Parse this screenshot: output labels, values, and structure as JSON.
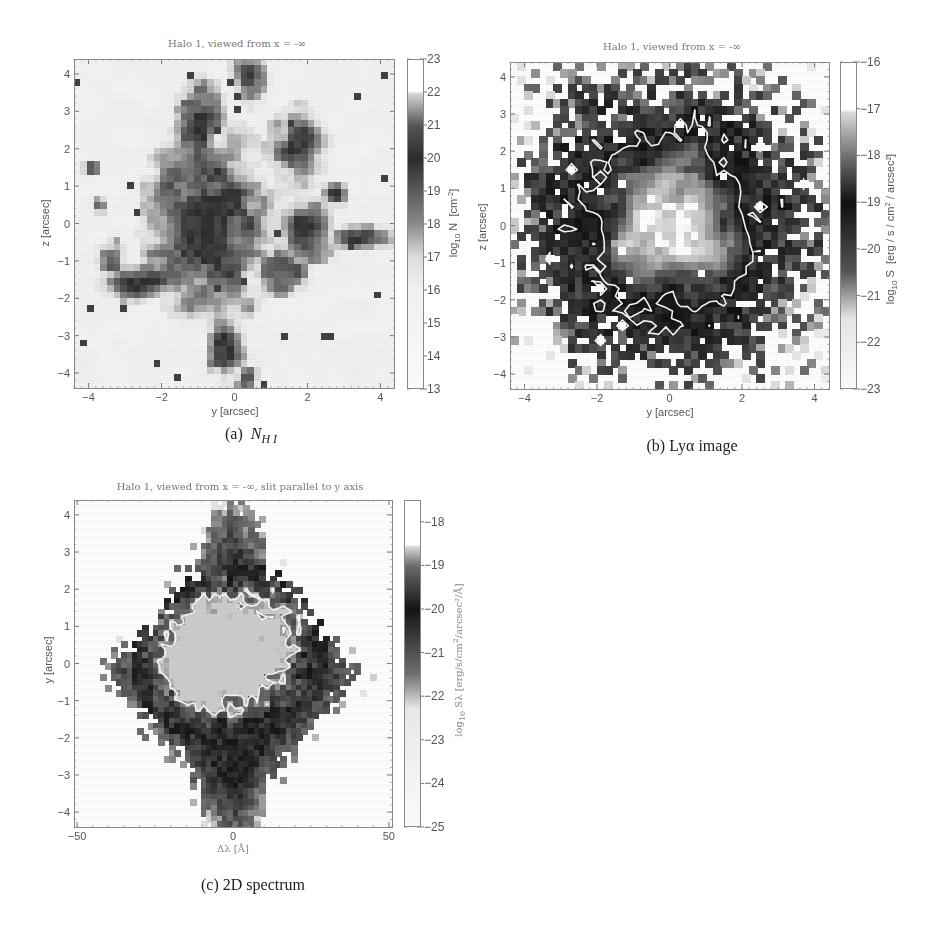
{
  "chart_data": [
    {
      "id": "a",
      "type": "heatmap",
      "title": "Halo 1, viewed from x = -∞",
      "xlabel": "y [arcsec]",
      "ylabel": "z [arcsec]",
      "xlim": [
        -4.4,
        4.4
      ],
      "ylim": [
        -4.4,
        4.4
      ],
      "xticks": [
        -4,
        -2,
        0,
        2,
        4
      ],
      "yticks": [
        -4,
        -3,
        -2,
        -1,
        0,
        1,
        2,
        3,
        4
      ],
      "grid": false,
      "grid_cells": 48,
      "colorbar": {
        "label": "log10 N [cm^-2]",
        "label_parts": {
          "pre": "log",
          "sub": "10",
          "mid": " N  [cm",
          "sup": "-2",
          "post": "]"
        },
        "range": [
          13,
          23
        ],
        "ticks": [
          13,
          14,
          15,
          16,
          17,
          18,
          19,
          20,
          21,
          22,
          23
        ],
        "colormap": [
          [
            13,
            "#fafafa"
          ],
          [
            16,
            "#f0f0f0"
          ],
          [
            17,
            "#dcdcdc"
          ],
          [
            18,
            "#8a8a8a"
          ],
          [
            20,
            "#2c2c2c"
          ],
          [
            21,
            "#555555"
          ],
          [
            22,
            "#d8d8d8"
          ],
          [
            22.05,
            "#ffffff"
          ],
          [
            23,
            "#ffffff"
          ]
        ]
      },
      "contour": {
        "color": "#a8a8a8",
        "description": "contours around high-column-density clumps"
      },
      "structure": {
        "background": 15.2,
        "blobs": [
          {
            "y": -0.6,
            "z": 0.0,
            "sy": 1.3,
            "sz": 1.9,
            "amp": 4.6
          },
          {
            "y": -0.9,
            "z": 2.8,
            "sy": 0.5,
            "sz": 0.8,
            "amp": 4.2
          },
          {
            "y": 0.4,
            "z": 3.8,
            "sy": 0.4,
            "sz": 0.6,
            "amp": 4.0
          },
          {
            "y": 1.8,
            "z": 2.0,
            "sy": 0.6,
            "sz": 0.8,
            "amp": 4.3
          },
          {
            "y": 1.9,
            "z": -0.3,
            "sy": 0.6,
            "sz": 0.7,
            "amp": 4.1
          },
          {
            "y": 3.6,
            "z": -0.4,
            "sy": 0.8,
            "sz": 0.25,
            "amp": 4.0
          },
          {
            "y": -2.6,
            "z": -1.6,
            "sy": 0.9,
            "sz": 0.35,
            "amp": 4.0
          },
          {
            "y": -3.4,
            "z": -1.0,
            "sy": 0.3,
            "sz": 0.4,
            "amp": 4.0
          },
          {
            "y": -0.2,
            "z": -3.3,
            "sy": 0.4,
            "sz": 0.8,
            "amp": 4.0
          },
          {
            "y": 0.3,
            "z": -4.2,
            "sy": 0.3,
            "sz": 0.3,
            "amp": 4.0
          },
          {
            "y": 2.8,
            "z": 0.8,
            "sy": 0.3,
            "sz": 0.25,
            "amp": 4.2
          },
          {
            "y": -3.7,
            "z": 0.5,
            "sy": 0.2,
            "sz": 0.2,
            "amp": 4.0
          },
          {
            "y": -3.9,
            "z": 1.5,
            "sy": 0.2,
            "sz": 0.15,
            "amp": 3.8
          },
          {
            "y": 1.3,
            "z": -1.3,
            "sy": 0.6,
            "sz": 0.5,
            "amp": 4.0
          }
        ],
        "seed": 7
      }
    },
    {
      "id": "b",
      "type": "heatmap",
      "title": "Halo 1, viewed from x = -∞",
      "xlabel": "y [arcsec]",
      "ylabel": "z [arcsec]",
      "xlim": [
        -4.4,
        4.4
      ],
      "ylim": [
        -4.4,
        4.4
      ],
      "xticks": [
        -4,
        -2,
        0,
        2,
        4
      ],
      "yticks": [
        -4,
        -3,
        -2,
        -1,
        0,
        1,
        2,
        3,
        4
      ],
      "grid": false,
      "grid_cells": 44,
      "colorbar": {
        "label": "log10 S [erg / s / cm^2 / arcsec^2]",
        "label_parts": {
          "pre": "log",
          "sub": "10",
          "mid": " S  [erg / s / cm",
          "sup": "2",
          "post": " / arcsec²]"
        },
        "range": [
          -23,
          -16
        ],
        "ticks": [
          -23,
          -22,
          -21,
          -20,
          -19,
          -18,
          -17,
          -16
        ],
        "colormap": [
          [
            -23,
            "#fafafa"
          ],
          [
            -21.5,
            "#e4e4e4"
          ],
          [
            -20.5,
            "#555555"
          ],
          [
            -19,
            "#111111"
          ],
          [
            -18,
            "#707070"
          ],
          [
            -17.05,
            "#dcdcdc"
          ],
          [
            -17,
            "#ffffff"
          ],
          [
            -16,
            "#ffffff"
          ]
        ]
      },
      "contour": {
        "color": "#f2f2f2",
        "level": -19,
        "description": "outer contour surrounding bright central core, radius ~2.2 arcsec"
      },
      "structure": {
        "core_peak": -16.6,
        "core_radius": 2.4,
        "halo_radius": 3.9,
        "seed": 11
      },
      "empty_threshold": -22.8
    },
    {
      "id": "c",
      "type": "heatmap",
      "title": "Halo 1, viewed from x = -∞, slit parallel to y axis",
      "xlabel": "Δλ [Å]",
      "ylabel": "y [arcsec]",
      "xlim": [
        -51,
        51
      ],
      "ylim": [
        -4.4,
        4.4
      ],
      "xticks": [
        -50,
        0,
        50
      ],
      "yticks": [
        -4,
        -3,
        -2,
        -1,
        0,
        1,
        2,
        3,
        4
      ],
      "grid": false,
      "grid_cells": 60,
      "colorbar": {
        "label": "log10 Sλ [erg/s/cm^2/arcsec^2/Å]",
        "label_parts": {
          "pre": "log",
          "sub": "10",
          "mid": " Sλ [erg/s/cm",
          "sup": "2",
          "post": "/arcsec²/Å]"
        },
        "range": [
          -25,
          -17.5
        ],
        "ticks": [
          -25,
          -24,
          -23,
          -22,
          -21,
          -20,
          -19,
          -18
        ],
        "colormap": [
          [
            -25,
            "#fafafa"
          ],
          [
            -22.3,
            "#e8e8e8"
          ],
          [
            -21.5,
            "#707070"
          ],
          [
            -20,
            "#151515"
          ],
          [
            -19,
            "#6a6a6a"
          ],
          [
            -18.55,
            "#d8d8d8"
          ],
          [
            -18.5,
            "#ffffff"
          ],
          [
            -17.5,
            "#ffffff"
          ]
        ]
      },
      "contour": {
        "color": "#f2f2f2",
        "description": "contour around bright double-peaked core spanning roughly -25 to +27 Å, -1.5 to 2.2 arcsec"
      },
      "structure": {
        "seed": 23
      },
      "empty_threshold": -24.6
    }
  ],
  "captions": {
    "a_prefix": "(a)",
    "a_symbol": "N",
    "a_sub": "H I",
    "b": "(b)  Lyα image",
    "c": "(c)  2D spectrum"
  }
}
